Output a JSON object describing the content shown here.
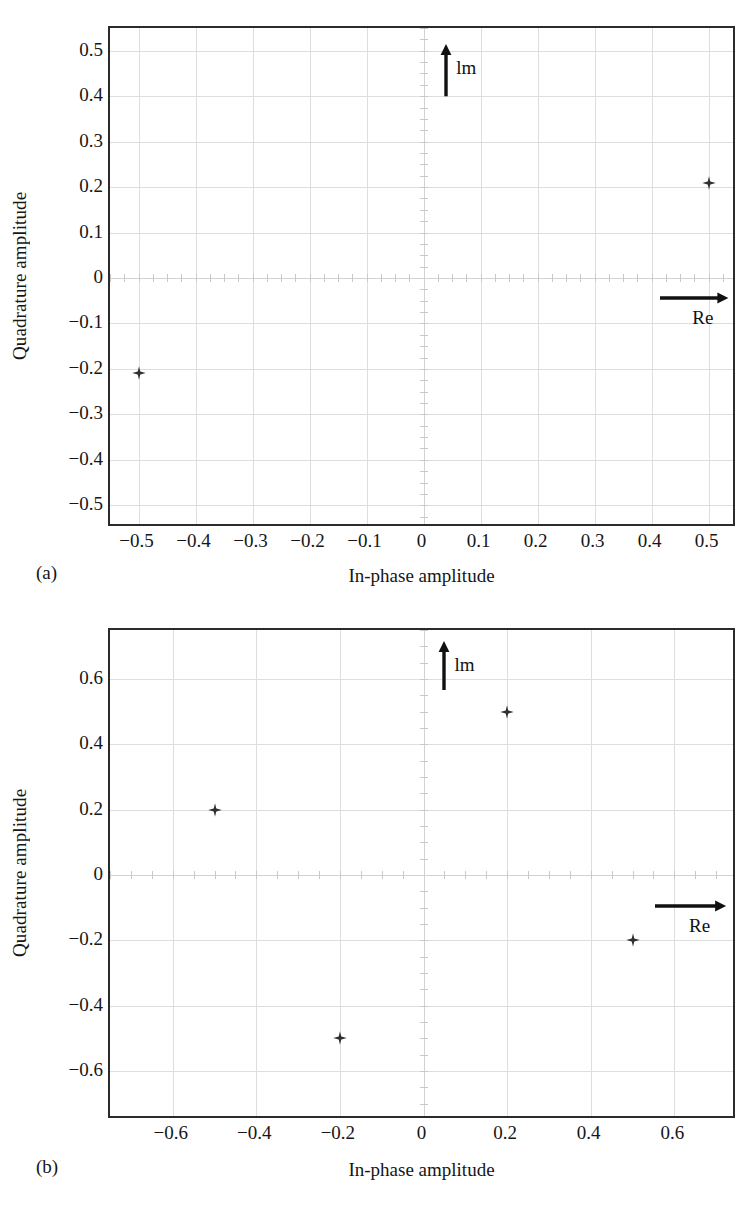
{
  "figure": {
    "panels": [
      {
        "key": "a",
        "caption": "(a)",
        "xlabel": "In-phase amplitude",
        "ylabel": "Quadrature amplitude",
        "im_label": "lm",
        "re_label": "Re"
      },
      {
        "key": "b",
        "caption": "(b)",
        "xlabel": "In-phase amplitude",
        "ylabel": "Quadrature amplitude",
        "im_label": "lm",
        "re_label": "Re"
      }
    ]
  },
  "chart_data": [
    {
      "type": "scatter",
      "panel": "a",
      "title": "",
      "xlabel": "In-phase amplitude",
      "ylabel": "Quadrature amplitude",
      "xlim": [
        -0.55,
        0.55
      ],
      "ylim": [
        -0.55,
        0.55
      ],
      "xticks": [
        -0.5,
        -0.4,
        -0.3,
        -0.2,
        -0.1,
        0,
        0.1,
        0.2,
        0.3,
        0.4,
        0.5
      ],
      "xticklabels": [
        "−0.5",
        "−0.4",
        "−0.3",
        "−0.2",
        "−0.1",
        "0",
        "0.1",
        "0.2",
        "0.3",
        "0.4",
        "0.5"
      ],
      "yticks": [
        0.5,
        0.4,
        0.3,
        0.2,
        0.1,
        0,
        -0.1,
        -0.2,
        -0.3,
        -0.4,
        -0.5
      ],
      "yticklabels": [
        "0.5",
        "0.4",
        "0.3",
        "0.2",
        "0.1",
        "0",
        "−0.1",
        "−0.2",
        "−0.3",
        "−0.4",
        "−0.5"
      ],
      "grid": true,
      "legend": "none",
      "marker": "star",
      "marker_color": "#303030",
      "points": [
        {
          "x": 0.5,
          "y": 0.21
        },
        {
          "x": -0.5,
          "y": -0.21
        }
      ],
      "annotations": [
        {
          "text": "lm",
          "kind": "arrow-up",
          "x": 0.04,
          "y0": 0.4,
          "y1": 0.515
        },
        {
          "text": "Re",
          "kind": "arrow-right",
          "y": -0.045,
          "x0": 0.415,
          "x1": 0.535
        }
      ]
    },
    {
      "type": "scatter",
      "panel": "b",
      "title": "",
      "xlabel": "In-phase amplitude",
      "ylabel": "Quadrature amplitude",
      "xlim": [
        -0.75,
        0.75
      ],
      "ylim": [
        -0.75,
        0.75
      ],
      "xticks": [
        -0.6,
        -0.4,
        -0.2,
        0,
        0.2,
        0.4,
        0.6
      ],
      "xticklabels": [
        "−0.6",
        "−0.4",
        "−0.2",
        "0",
        "0.2",
        "0.4",
        "0.6"
      ],
      "yticks": [
        0.6,
        0.4,
        0.2,
        0,
        -0.2,
        -0.4,
        -0.6
      ],
      "yticklabels": [
        "0.6",
        "0.4",
        "0.2",
        "0",
        "−0.2",
        "−0.4",
        "−0.6"
      ],
      "grid": true,
      "legend": "none",
      "marker": "star",
      "marker_color": "#303030",
      "points": [
        {
          "x": -0.5,
          "y": 0.2
        },
        {
          "x": 0.2,
          "y": 0.5
        },
        {
          "x": 0.5,
          "y": -0.2
        },
        {
          "x": -0.2,
          "y": -0.5
        }
      ],
      "annotations": [
        {
          "text": "lm",
          "kind": "arrow-up",
          "x": 0.05,
          "y0": 0.565,
          "y1": 0.715
        },
        {
          "text": "Re",
          "kind": "arrow-right",
          "y": -0.095,
          "x0": 0.555,
          "x1": 0.725
        }
      ]
    }
  ]
}
